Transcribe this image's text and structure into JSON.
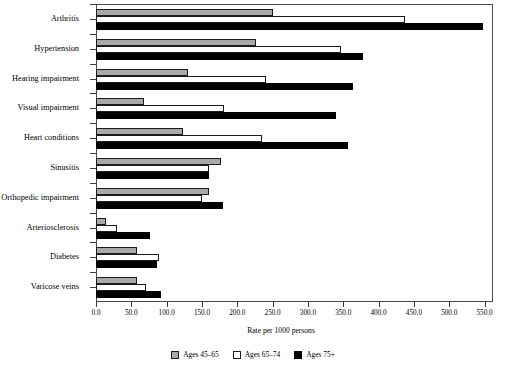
{
  "chart_data": {
    "type": "bar",
    "orientation": "horizontal",
    "title": "",
    "xlabel": "Rate per 1000 persons",
    "ylabel": "",
    "xlim": [
      0,
      560
    ],
    "xticks": [
      "0.0",
      "50.0",
      "100.0",
      "150.0",
      "200.0",
      "250.0",
      "300.0",
      "350.0",
      "400.0",
      "450.0",
      "500.0",
      "550.0"
    ],
    "xtick_values": [
      0,
      50,
      100,
      150,
      200,
      250,
      300,
      350,
      400,
      450,
      500,
      550
    ],
    "grid": false,
    "legend_position": "bottom",
    "categories": [
      "Arthritis",
      "Hypertension",
      "Hearing impairment",
      "Visual impairment",
      "Heart conditions",
      "Sinusitis",
      "Orthopedic impairment",
      "Arteriosclerosis",
      "Diabetes",
      "Varicose veins"
    ],
    "series": [
      {
        "name": "Ages 45–65",
        "color": "#a9a9a9",
        "values": [
          250,
          227,
          130,
          68,
          123,
          177,
          160,
          14,
          58,
          58
        ]
      },
      {
        "name": "Ages 65–74",
        "color": "#ffffff",
        "values": [
          438,
          347,
          241,
          181,
          235,
          160,
          150,
          30,
          89,
          71
        ]
      },
      {
        "name": "Ages 75+",
        "color": "#000000",
        "values": [
          548,
          378,
          364,
          340,
          357,
          160,
          180,
          76,
          86,
          92
        ]
      }
    ]
  }
}
